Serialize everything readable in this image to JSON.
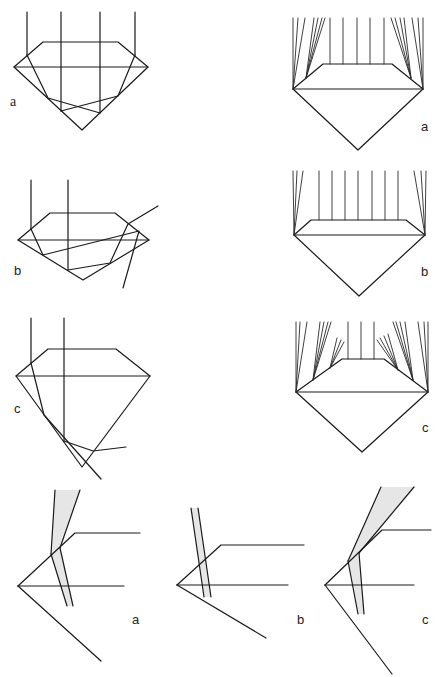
{
  "figure": {
    "left_column": {
      "panels": [
        {
          "label": "a",
          "caption": "ideal cut - rays reflect and exit through crown"
        },
        {
          "label": "b",
          "caption": "shallow cut - rays leak through pavilion"
        },
        {
          "label": "c",
          "caption": "deep cut - rays leak through pavilion side"
        }
      ]
    },
    "right_column": {
      "panels": [
        {
          "label": "a",
          "caption": "ideal cut light return"
        },
        {
          "label": "b",
          "caption": "shallow cut light return"
        },
        {
          "label": "c",
          "caption": "deep cut light return"
        }
      ]
    },
    "bottom_row": {
      "panels": [
        {
          "label": "a"
        },
        {
          "label": "b"
        },
        {
          "label": "c"
        }
      ]
    },
    "colors": {
      "line": "#1a1a1a",
      "beam_fill": "#e6e6e6",
      "background": "#ffffff"
    }
  }
}
